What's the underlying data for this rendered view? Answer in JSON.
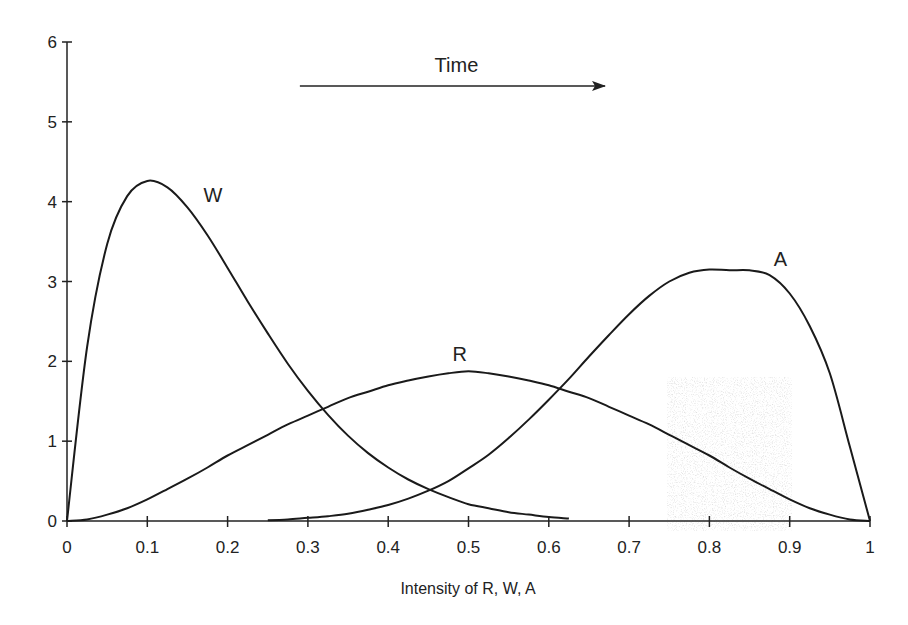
{
  "chart_data": {
    "type": "line",
    "title": "",
    "xlabel": "Intensity of R, W, A",
    "ylabel": "",
    "xlim": [
      0,
      1
    ],
    "ylim": [
      0,
      6
    ],
    "grid": false,
    "legend": "none (inline series labels)",
    "x_ticks": [
      "0",
      "0.1",
      "0.2",
      "0.3",
      "0.4",
      "0.5",
      "0.6",
      "0.7",
      "0.8",
      "0.9",
      "1"
    ],
    "y_ticks": [
      "0",
      "1",
      "2",
      "3",
      "4",
      "5",
      "6"
    ],
    "x": [
      0,
      0.025,
      0.05,
      0.075,
      0.1,
      0.125,
      0.15,
      0.175,
      0.2,
      0.225,
      0.25,
      0.275,
      0.3,
      0.325,
      0.35,
      0.375,
      0.4,
      0.425,
      0.45,
      0.475,
      0.5,
      0.525,
      0.55,
      0.575,
      0.6,
      0.625,
      0.65,
      0.675,
      0.7,
      0.725,
      0.75,
      0.775,
      0.8,
      0.825,
      0.85,
      0.875,
      0.9,
      0.925,
      0.95,
      0.975,
      1
    ],
    "series": [
      {
        "name": "W",
        "label_position": [
          0.17,
          4.0
        ],
        "x_range": [
          0,
          0.63
        ],
        "values": [
          0,
          2.18,
          3.47,
          4.07,
          4.26,
          4.18,
          3.93,
          3.58,
          3.17,
          2.75,
          2.35,
          1.97,
          1.63,
          1.33,
          1.07,
          0.85,
          0.67,
          0.52,
          0.4,
          0.3,
          0.21,
          0.16,
          0.11,
          0.08,
          0.05,
          0.03,
          0.02,
          0.01,
          0.01,
          0,
          0,
          0,
          0,
          0,
          0,
          0,
          0,
          0,
          0,
          0,
          0
        ]
      },
      {
        "name": "R",
        "label_position": [
          0.48,
          2.0
        ],
        "x_range": [
          0,
          1
        ],
        "values": [
          0,
          0.02,
          0.08,
          0.16,
          0.27,
          0.4,
          0.53,
          0.67,
          0.82,
          0.95,
          1.08,
          1.21,
          1.32,
          1.43,
          1.54,
          1.62,
          1.7,
          1.76,
          1.81,
          1.85,
          1.875,
          1.85,
          1.81,
          1.76,
          1.7,
          1.62,
          1.54,
          1.43,
          1.32,
          1.21,
          1.08,
          0.95,
          0.82,
          0.67,
          0.53,
          0.4,
          0.27,
          0.16,
          0.08,
          0.02,
          0
        ]
      },
      {
        "name": "A",
        "label_position": [
          0.88,
          3.2
        ],
        "x_range": [
          0.25,
          1
        ],
        "values": [
          0,
          0,
          0,
          0,
          0,
          0,
          0,
          0,
          0,
          0,
          0.01,
          0.02,
          0.04,
          0.06,
          0.09,
          0.14,
          0.2,
          0.28,
          0.38,
          0.5,
          0.66,
          0.83,
          1.04,
          1.27,
          1.52,
          1.78,
          2.06,
          2.33,
          2.59,
          2.82,
          3.0,
          3.11,
          3.15,
          3.14,
          3.14,
          3.08,
          2.85,
          2.44,
          1.85,
          0.93,
          0
        ]
      }
    ],
    "annotations": {
      "time_arrow": {
        "label": "Time",
        "x_start": 0.29,
        "x_end": 0.67,
        "y": 5.45
      }
    },
    "artifacts": {
      "scan_noise_region": [
        0.75,
        0.9,
        0,
        1.8
      ]
    }
  }
}
